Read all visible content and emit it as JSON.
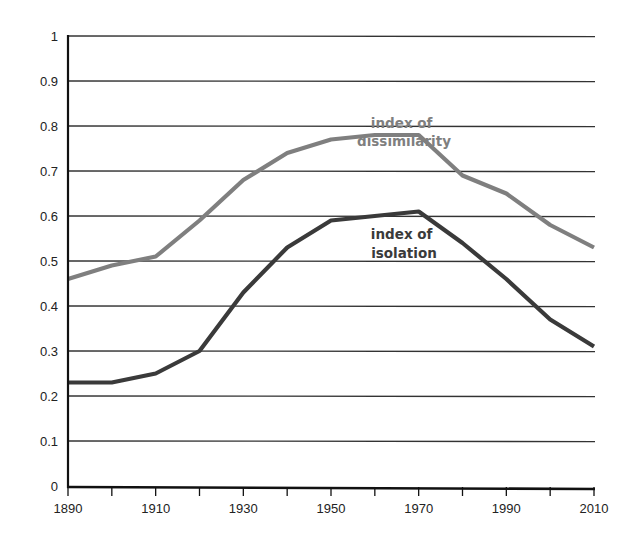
{
  "chart_data": {
    "type": "line",
    "title": "",
    "xlabel": "",
    "ylabel": "",
    "x": [
      1890,
      1900,
      1910,
      1920,
      1930,
      1940,
      1950,
      1960,
      1970,
      1980,
      1990,
      2000,
      2010
    ],
    "xticks": [
      1890,
      1910,
      1930,
      1950,
      1970,
      1990,
      2010
    ],
    "yticks": [
      0,
      0.1,
      0.2,
      0.3,
      0.4,
      0.5,
      0.6,
      0.7,
      0.8,
      0.9,
      1
    ],
    "ylim": [
      0,
      1
    ],
    "xlim": [
      1890,
      2010
    ],
    "grid": true,
    "legend": "inline labels",
    "series": [
      {
        "name": "index of dissimilarity",
        "label_lines": [
          "index of",
          "dissimilarity"
        ],
        "color": "#7f7f7f",
        "values": [
          0.46,
          0.49,
          0.51,
          0.59,
          0.68,
          0.74,
          0.77,
          0.78,
          0.78,
          0.69,
          0.65,
          0.58,
          0.53
        ]
      },
      {
        "name": "index of isolation",
        "label_lines": [
          "index of",
          "isolation"
        ],
        "color": "#3a3a3a",
        "values": [
          0.23,
          0.23,
          0.25,
          0.3,
          0.43,
          0.53,
          0.59,
          0.6,
          0.61,
          0.54,
          0.46,
          0.37,
          0.31
        ]
      }
    ]
  }
}
